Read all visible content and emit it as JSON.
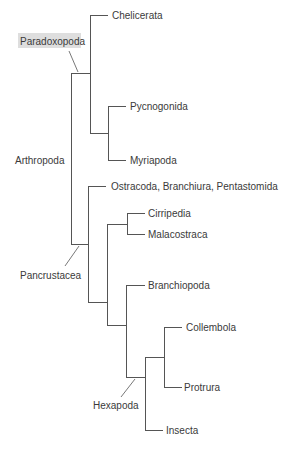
{
  "diagram": {
    "type": "phylogenetic-tree",
    "colors": {
      "line": "#555555",
      "text": "#3a3a3a",
      "highlight": "#dedede",
      "background": "#ffffff"
    },
    "leaves": [
      {
        "id": "chelicerata",
        "label": "Chelicerata"
      },
      {
        "id": "pycnogonida",
        "label": "Pycnogonida"
      },
      {
        "id": "myriapoda",
        "label": "Myriapoda"
      },
      {
        "id": "ostracoda",
        "label": "Ostracoda, Branchiura, Pentastomida"
      },
      {
        "id": "cirripedia",
        "label": "Cirripedia"
      },
      {
        "id": "malacostraca",
        "label": "Malacostraca"
      },
      {
        "id": "branchiopoda",
        "label": "Branchiopoda"
      },
      {
        "id": "collembola",
        "label": "Collembola"
      },
      {
        "id": "protrura",
        "label": "Protrura"
      },
      {
        "id": "insecta",
        "label": "Insecta"
      }
    ],
    "clades": [
      {
        "id": "paradoxopoda",
        "label": "Paradoxopoda",
        "highlighted": true
      },
      {
        "id": "arthropoda",
        "label": "Arthropoda",
        "highlighted": false
      },
      {
        "id": "pancrustacea",
        "label": "Pancrustacea",
        "highlighted": false
      },
      {
        "id": "hexapoda",
        "label": "Hexapoda",
        "highlighted": false
      }
    ],
    "newick": "((Chelicerata,(Pycnogonida,Myriapoda))Paradoxopoda,(Ostracoda_Branchiura_Pentastomida,((Cirripedia,Malacostraca),(Branchiopoda,((Collembola,Protrura),Insecta)Hexapoda)))Pancrustacea)Arthropoda;"
  }
}
